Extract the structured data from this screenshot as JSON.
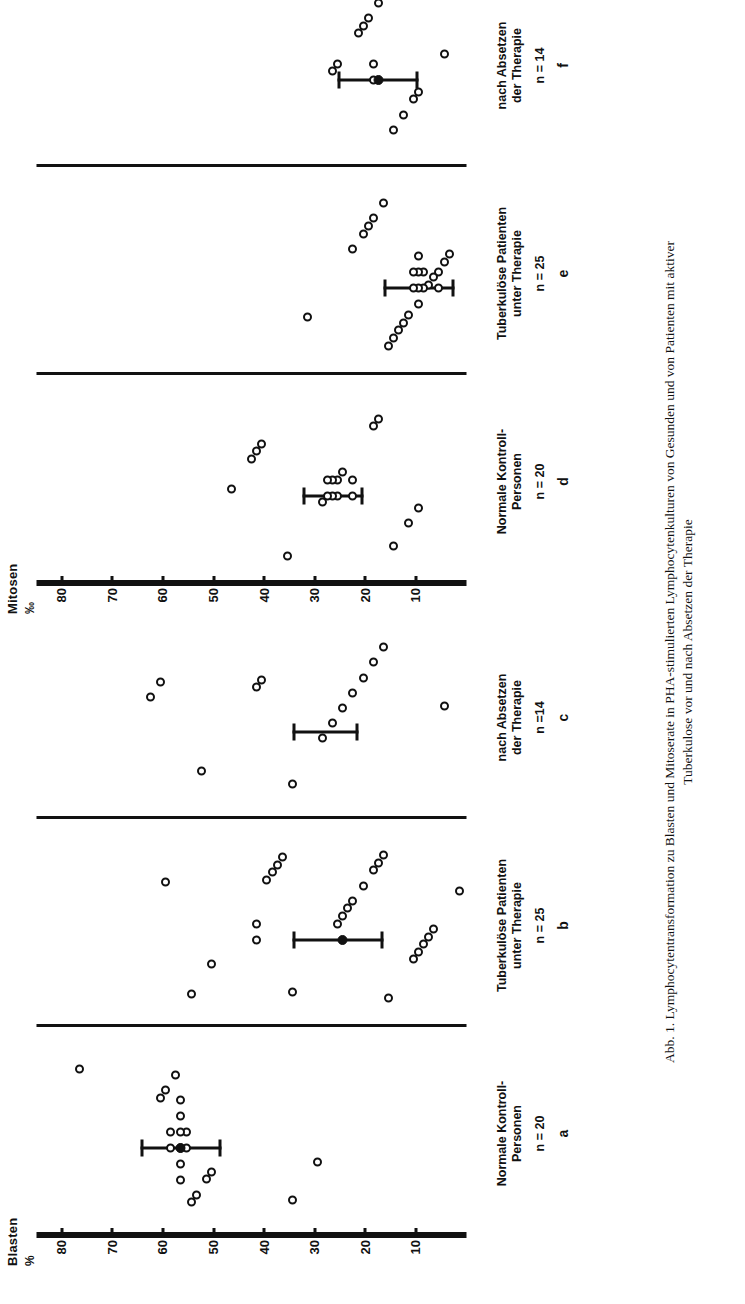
{
  "figure": {
    "caption_line1": "Abb. 1. Lymphocytentransformation zu Blasten und Mitoserate in PHA-stimulierten Lymphocytenkulturen von Gesunden und von Patienten mit aktiver",
    "caption_line2": "Tuberkulose vor und nach Absetzen der Therapie"
  },
  "chart_data": {
    "type": "scatter",
    "title": "Lymphocytentransformation zu Blasten und Mitoserate in PHA-stimulierten Lymphocytenkulturen",
    "orientation": "rotated-90",
    "grid": false,
    "legend": "none",
    "groups": [
      {
        "group_id": "blasten",
        "ylabel": "Blasten",
        "yunit": "%",
        "ylim": [
          0,
          85
        ],
        "yticks": [
          80,
          70,
          60,
          50,
          40,
          30,
          20,
          10
        ],
        "panels": [
          {
            "letter": "a",
            "title": "Normale Kontroll-\nPersonen",
            "n_label": "n = 20",
            "n": 20,
            "values": [
              80,
              64,
              63,
              62,
              62,
              61,
              60,
              60,
              60,
              60,
              60,
              60,
              59,
              59,
              58,
              57,
              55,
              54,
              38,
              33
            ],
            "mean": 60,
            "error_low": 52,
            "error_high": 68
          },
          {
            "letter": "b",
            "title": "Tuberkulöse Patienten\nunter Therapie",
            "n_label": "n = 25",
            "n": 25,
            "values": [
              63,
              58,
              54,
              45,
              45,
              43,
              42,
              41,
              40,
              38,
              29,
              28,
              27,
              26,
              24,
              22,
              21,
              20,
              19,
              14,
              13,
              12,
              11,
              10,
              5
            ],
            "mean": 28,
            "error_low": 20,
            "error_high": 38
          },
          {
            "letter": "c",
            "title": "nach Absetzen\nder Therapie",
            "n_label": "n =14",
            "n": 14,
            "values": [
              66,
              64,
              56,
              45,
              44,
              38,
              32,
              30,
              28,
              26,
              24,
              22,
              20,
              8
            ],
            "mean": null,
            "error_low": 25,
            "error_high": 38
          }
        ]
      },
      {
        "group_id": "mitosen",
        "ylabel": "Mitosen",
        "yunit": "‰",
        "ylim": [
          0,
          85
        ],
        "yticks": [
          80,
          70,
          60,
          50,
          40,
          30,
          20,
          10
        ],
        "panels": [
          {
            "letter": "d",
            "title": "Normale Kontroll-\nPersonen",
            "n_label": "n = 20",
            "n": 20,
            "values": [
              50,
              46,
              45,
              44,
              39,
              32,
              31,
              31,
              30,
              30,
              29,
              29,
              28,
              26,
              26,
              22,
              21,
              18,
              15,
              13
            ],
            "mean": null,
            "error_low": 24,
            "error_high": 36
          },
          {
            "letter": "e",
            "title": "Tuberkulöse Patienten\nunter Therapie",
            "n_label": "n = 25",
            "n": 25,
            "values": [
              35,
              26,
              24,
              23,
              22,
              20,
              19,
              18,
              17,
              16,
              15,
              14,
              14,
              13,
              13,
              13,
              13,
              12,
              12,
              11,
              10,
              9,
              9,
              8,
              7
            ],
            "mean": null,
            "error_low": 6,
            "error_high": 20
          },
          {
            "letter": "f",
            "title": "nach Absetzen\nder Therapie",
            "n_label": "n = 14",
            "n": 14,
            "values": [
              30,
              29,
              25,
              24,
              23,
              22,
              22,
              21,
              20,
              18,
              16,
              14,
              13,
              8
            ],
            "mean": 21,
            "error_low": 13,
            "error_high": 29
          }
        ]
      }
    ]
  }
}
